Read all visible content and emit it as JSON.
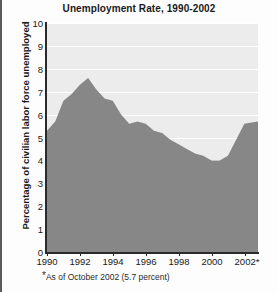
{
  "chart_data": {
    "type": "area",
    "title": "Unemployment Rate, 1990-2002",
    "xlabel": "",
    "ylabel": "Percentage of civilian labor force unemployed",
    "xlim": [
      1990,
      2002.83
    ],
    "ylim": [
      0,
      10
    ],
    "grid": true,
    "legend": "none",
    "footnote": "As of October 2002 (5.7 percent)",
    "footnote_marker": "*",
    "x_tick_labels": [
      "1990",
      "1992",
      "1994",
      "1996",
      "1998",
      "2000",
      "2002*"
    ],
    "x_ticks": [
      1990,
      1992,
      1994,
      1996,
      1998,
      2000,
      2002
    ],
    "y_tick_labels": [
      "10",
      "9",
      "8",
      "7",
      "6",
      "5",
      "4",
      "3",
      "2",
      "1",
      "0"
    ],
    "y_ticks": [
      10,
      9,
      8,
      7,
      6,
      5,
      4,
      3,
      2,
      1,
      0
    ],
    "series": [
      {
        "name": "Unemployment rate",
        "x": [
          1990.0,
          1990.5,
          1991.0,
          1991.5,
          1992.0,
          1992.5,
          1993.0,
          1993.5,
          1994.0,
          1994.5,
          1995.0,
          1995.5,
          1996.0,
          1996.5,
          1997.0,
          1997.5,
          1998.0,
          1998.5,
          1999.0,
          1999.5,
          2000.0,
          2000.5,
          2001.0,
          2001.5,
          2002.0,
          2002.83
        ],
        "values": [
          5.3,
          5.7,
          6.6,
          6.9,
          7.3,
          7.6,
          7.1,
          6.7,
          6.6,
          6.0,
          5.6,
          5.7,
          5.6,
          5.3,
          5.2,
          4.9,
          4.7,
          4.5,
          4.3,
          4.2,
          4.0,
          4.0,
          4.2,
          4.9,
          5.6,
          5.7
        ]
      }
    ],
    "colors": {
      "plot_background": "#ececec",
      "area_fill": "#878787",
      "gridline": "#ffffff",
      "axis": "#2a2a2a",
      "text": "#1a1a1a"
    }
  }
}
